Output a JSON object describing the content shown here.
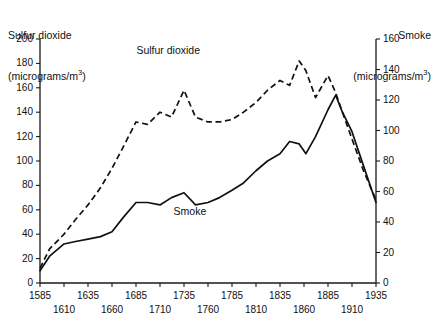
{
  "chart_data": {
    "type": "line",
    "title": "",
    "xlabel": "",
    "ylabel": "Sulfur dioxide (micrograms/m3)",
    "y2label": "Smoke (micrograms/m3)",
    "xlim": [
      1585,
      1935
    ],
    "ylim": [
      0,
      200
    ],
    "y2lim": [
      0,
      160
    ],
    "grid": false,
    "legend": "inline-annotations",
    "xticks": [
      1585,
      1610,
      1635,
      1660,
      1685,
      1710,
      1735,
      1760,
      1785,
      1810,
      1835,
      1860,
      1885,
      1910,
      1935
    ],
    "xticklabels_row1": [
      "1585",
      "1635",
      "1685",
      "1735",
      "1785",
      "1835",
      "1885",
      "1935"
    ],
    "xticklabels_row2": [
      "1610",
      "1660",
      "1710",
      "1760",
      "1810",
      "1860",
      "1910"
    ],
    "yticks_left": [
      0,
      20,
      40,
      60,
      80,
      100,
      120,
      140,
      160,
      180,
      200
    ],
    "yticks_right": [
      0,
      20,
      40,
      60,
      80,
      100,
      120,
      140,
      160
    ],
    "series": [
      {
        "name": "Sulfur dioxide",
        "style": "dashed",
        "axis": "left",
        "unit": "micrograms/m3",
        "x": [
          1585,
          1595,
          1610,
          1622,
          1635,
          1648,
          1660,
          1672,
          1685,
          1697,
          1710,
          1722,
          1735,
          1747,
          1760,
          1772,
          1785,
          1797,
          1810,
          1822,
          1835,
          1845,
          1855,
          1862,
          1872,
          1885,
          1893,
          1900,
          1910,
          1922,
          1935
        ],
        "y": [
          12,
          28,
          40,
          52,
          64,
          78,
          94,
          112,
          132,
          130,
          140,
          136,
          158,
          136,
          132,
          132,
          134,
          140,
          148,
          158,
          166,
          162,
          182,
          174,
          152,
          170,
          156,
          140,
          118,
          92,
          68
        ]
      },
      {
        "name": "Smoke",
        "style": "solid",
        "axis": "right",
        "unit": "micrograms/m3",
        "x": [
          1585,
          1595,
          1610,
          1622,
          1635,
          1648,
          1660,
          1672,
          1685,
          1697,
          1710,
          1722,
          1735,
          1747,
          1760,
          1772,
          1785,
          1797,
          1810,
          1822,
          1835,
          1845,
          1855,
          1862,
          1872,
          1885,
          1893,
          1900,
          1910,
          1922,
          1935
        ],
        "y_left_scale": [
          10,
          22,
          32,
          34,
          36,
          38,
          42,
          54,
          66,
          66,
          64,
          70,
          74,
          64,
          66,
          70,
          76,
          82,
          92,
          100,
          106,
          116,
          114,
          106,
          120,
          142,
          154,
          140,
          124,
          96,
          66
        ],
        "y_right_scale": [
          8,
          18,
          26,
          27,
          29,
          30,
          34,
          43,
          53,
          53,
          51,
          56,
          59,
          51,
          53,
          56,
          61,
          66,
          74,
          80,
          85,
          93,
          91,
          85,
          96,
          114,
          123,
          112,
          99,
          77,
          53
        ]
      }
    ],
    "annotations": [
      {
        "text": "Sulfur dioxide",
        "x": 1725,
        "y": 190
      },
      {
        "text": "Smoke",
        "x": 1745,
        "y": 58
      }
    ]
  },
  "labels": {
    "left_axis_line1": "Sulfur dioxide",
    "left_axis_line2_pre": "(micrograms/m",
    "left_axis_sup": "3",
    "left_axis_line2_post": ")",
    "right_axis_line1": "Smoke",
    "right_axis_line2_pre": "(micrograms/m",
    "right_axis_sup": "3",
    "right_axis_line2_post": ")",
    "series_sulfur": "Sulfur dioxide",
    "series_smoke": "Smoke"
  }
}
